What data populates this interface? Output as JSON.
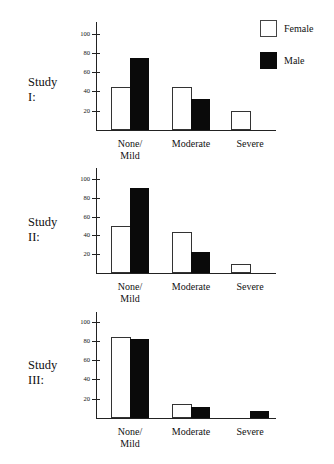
{
  "legend": [
    {
      "label": "Female",
      "color": "#ffffff"
    },
    {
      "label": "Male",
      "color": "#0a0a0a"
    }
  ],
  "categories": [
    "None/\nMild",
    "Moderate",
    "Severe"
  ],
  "category_labels": {
    "none_mild_1": "None/",
    "none_mild_2": "Mild",
    "moderate": "Moderate",
    "severe": "Severe"
  },
  "y_ticks": [
    "100",
    "80",
    "60",
    "40",
    "20"
  ],
  "studies": [
    {
      "label": "Study I:",
      "female": [
        45,
        45,
        20
      ],
      "male": [
        75,
        32,
        0
      ]
    },
    {
      "label": "Study II:",
      "female": [
        50,
        44,
        10
      ],
      "male": [
        90,
        22,
        0
      ]
    },
    {
      "label": "Study III:",
      "female": [
        84,
        15,
        0
      ],
      "male": [
        82,
        11,
        7
      ]
    }
  ],
  "chart_data": [
    {
      "type": "bar",
      "title": "Study I:",
      "categories": [
        "None/Mild",
        "Moderate",
        "Severe"
      ],
      "series": [
        {
          "name": "Female",
          "values": [
            45,
            45,
            20
          ]
        },
        {
          "name": "Male",
          "values": [
            75,
            32,
            0
          ]
        }
      ],
      "xlabel": "",
      "ylabel": "",
      "ylim": [
        0,
        100
      ],
      "yticks": [
        20,
        40,
        60,
        80,
        100
      ],
      "legend_position": "upper right",
      "grid": false
    },
    {
      "type": "bar",
      "title": "Study II:",
      "categories": [
        "None/Mild",
        "Moderate",
        "Severe"
      ],
      "series": [
        {
          "name": "Female",
          "values": [
            50,
            44,
            10
          ]
        },
        {
          "name": "Male",
          "values": [
            90,
            22,
            0
          ]
        }
      ],
      "xlabel": "",
      "ylabel": "",
      "ylim": [
        0,
        100
      ],
      "yticks": [
        20,
        40,
        60,
        80,
        100
      ],
      "grid": false
    },
    {
      "type": "bar",
      "title": "Study III:",
      "categories": [
        "None/Mild",
        "Moderate",
        "Severe"
      ],
      "series": [
        {
          "name": "Female",
          "values": [
            84,
            15,
            0
          ]
        },
        {
          "name": "Male",
          "values": [
            82,
            11,
            7
          ]
        }
      ],
      "xlabel": "",
      "ylabel": "",
      "ylim": [
        0,
        100
      ],
      "yticks": [
        20,
        40,
        60,
        80,
        100
      ],
      "grid": false
    }
  ]
}
